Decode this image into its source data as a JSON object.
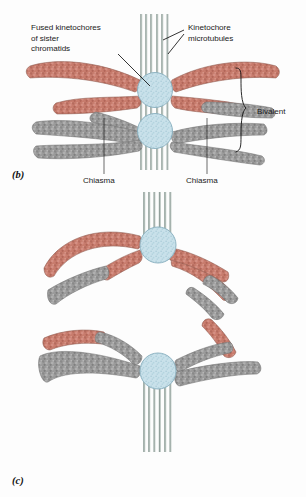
{
  "figure": {
    "title_alt": "Meiosis I bivalent and chromosome orientation diagram",
    "background_color": "#fdfdfd"
  },
  "palette": {
    "chromatid_red": "#c87c6d",
    "chromatid_red_dark": "#a85d50",
    "chromatid_red_light": "#dda093",
    "chromatid_gray": "#9b9b9b",
    "chromatid_gray_dark": "#6f6f6f",
    "chromatid_gray_light": "#c3c3c3",
    "kinetochore_blue": "#c3dde7",
    "kinetochore_blue_dark": "#8fb6c4",
    "kinetochore_speckle": "#9ec6d4",
    "microtubule": "#9aa8a4",
    "microtubule_light": "#d7ddda",
    "outline": "#6b6b6b",
    "text": "#1b1b1b",
    "leader_line": "#111111"
  },
  "panels": [
    {
      "id": "panel-b",
      "letter": "(b)",
      "letter_x": 12,
      "letter_y": 178
    },
    {
      "id": "panel-c",
      "letter": "(c)",
      "letter_x": 12,
      "letter_y": 484
    }
  ],
  "annotations": {
    "fused_kinetochores": {
      "name": "fused-kinetochores-label",
      "lines": [
        "Fused kinetochores",
        "of sister",
        "chromatids"
      ],
      "x": 31,
      "y": 30,
      "line_height": 10.6
    },
    "kinetochore_microtubules": {
      "name": "kinetochore-microtubules-label",
      "lines": [
        "Kinetochore",
        "microtubules"
      ],
      "x": 188,
      "y": 30,
      "line_height": 10.6
    },
    "bivalent": {
      "name": "bivalent-label",
      "text": "Bivalent",
      "x": 257,
      "y": 114
    },
    "chiasma_left": {
      "name": "chiasma-label-left",
      "text": "Chiasma",
      "x": 83,
      "y": 183
    },
    "chiasma_right": {
      "name": "chiasma-label-right",
      "text": "Chiasma",
      "x": 186,
      "y": 183
    }
  },
  "structures": {
    "panel_b": {
      "kinetochore_top": {
        "cx": 155,
        "cy": 90,
        "r": 17.5
      },
      "kinetochore_bottom": {
        "cx": 155,
        "cy": 131,
        "r": 17.5
      },
      "microtubule_count": 6,
      "microtubule_top_y": 14,
      "microtubule_bottom_y": 170,
      "chromatid_arm_count": 8,
      "chiasma_points": [
        {
          "x": 104,
          "y": 120
        },
        {
          "x": 207,
          "y": 120
        }
      ]
    },
    "panel_c": {
      "kinetochore_upper": {
        "cx": 158,
        "cy": 245,
        "r": 18
      },
      "kinetochore_lower": {
        "cx": 158,
        "cy": 371,
        "r": 18
      },
      "microtubule_count": 6,
      "microtubule_upper_top_y": 192,
      "microtubule_lower_bottom_y": 452,
      "chromatid_arm_count": 8
    }
  }
}
